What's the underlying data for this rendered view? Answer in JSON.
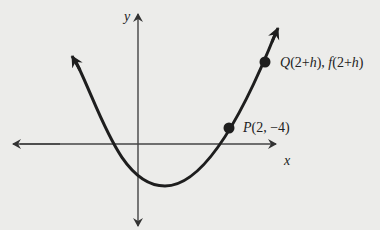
{
  "diagram": {
    "axes": {
      "x_label": "x",
      "y_label": "y"
    },
    "points": {
      "P": {
        "name": "P",
        "coords": "(2, −4)"
      },
      "Q": {
        "name": "Q",
        "coords_open": "(2+",
        "h1": "h",
        "mid": "), ",
        "f": "f",
        "coords2": "(2+",
        "h2": "h",
        "close": ")"
      }
    },
    "colors": {
      "background": "#ececea",
      "ink": "#1e1e1e",
      "axis": "#444444"
    }
  }
}
